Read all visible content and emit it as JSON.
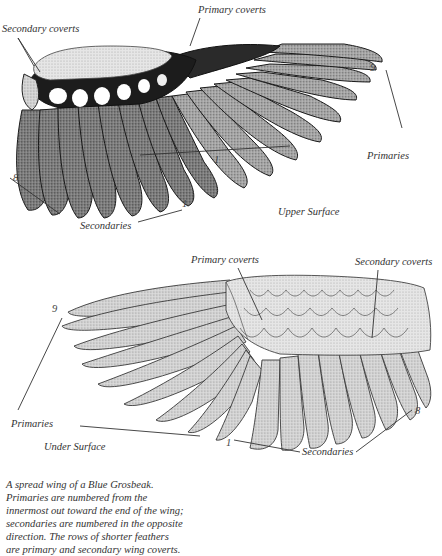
{
  "upper_wing": {
    "surface_label": "Upper Surface",
    "labels": {
      "secondary_coverts": "Secondary coverts",
      "primary_coverts": "Primary coverts",
      "primaries": "Primaries",
      "secondaries": "Secondaries"
    },
    "numbers": {
      "primary_outer": "9",
      "primary_inner": "1",
      "secondary_inner": "1",
      "secondary_outer": "8"
    }
  },
  "under_wing": {
    "surface_label": "Under Surface",
    "labels": {
      "primary_coverts": "Primary coverts",
      "secondary_coverts": "Secondary coverts",
      "primaries": "Primaries",
      "secondaries": "Secondaries"
    },
    "numbers": {
      "primary_outer": "9",
      "secondary_inner": "1",
      "secondary_outer": "8"
    }
  },
  "caption": {
    "lines": [
      "A spread wing of a Blue Grosbeak.",
      "Primaries are numbered from the",
      "innermost out toward the end of the wing;",
      "secondaries are numbered in the opposite",
      "direction.  The rows of shorter feathers",
      "are primary and secondary wing coverts."
    ]
  },
  "colors": {
    "ink": "#1a1a1a",
    "upper_feather_fill": "#8a8a8a",
    "under_feather_fill": "#cfcfcf",
    "background": "#ffffff"
  }
}
